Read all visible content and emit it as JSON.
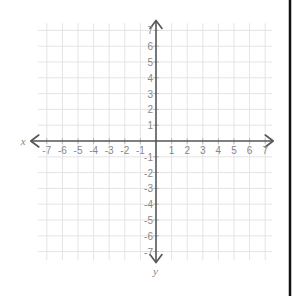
{
  "chart_data": {
    "type": "scatter",
    "title": "",
    "xlabel": "x",
    "ylabel": "y",
    "xlim": [
      -7,
      7
    ],
    "ylim": [
      -7,
      7
    ],
    "grid": true,
    "x_ticks": [
      -7,
      -6,
      -5,
      -4,
      -3,
      -2,
      -1,
      1,
      2,
      3,
      4,
      5,
      6,
      7
    ],
    "y_ticks": [
      -7,
      -6,
      -5,
      -4,
      -3,
      -2,
      -1,
      1,
      2,
      3,
      4,
      5,
      6,
      7
    ],
    "x_tick_labels": [
      "-7",
      "-6",
      "-5",
      "-4",
      "-3",
      "-2",
      "-1",
      "1",
      "2",
      "3",
      "4",
      "5",
      "6",
      "7"
    ],
    "y_tick_labels": [
      "-7",
      "-6",
      "-5",
      "-4",
      "-3",
      "-2",
      "-1",
      "1",
      "2",
      "3",
      "4",
      "5",
      "6",
      "7"
    ],
    "series": [],
    "colors": {
      "grid": "#e4e4e4",
      "axis": "#555555",
      "labels": "#888888",
      "border": "#111111"
    }
  }
}
